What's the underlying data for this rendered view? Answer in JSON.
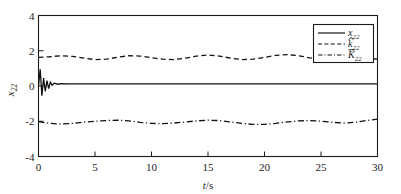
{
  "chart_data": {
    "type": "line",
    "title": "",
    "xlabel": "t/s",
    "ylabel": "x22",
    "xlim": [
      0,
      30
    ],
    "ylim": [
      -4,
      4
    ],
    "xticks": [
      "0",
      "5",
      "10",
      "15",
      "20",
      "25",
      "30"
    ],
    "xtick_values": [
      0,
      5,
      10,
      15,
      20,
      25,
      30
    ],
    "yticks": [
      "4",
      "2",
      "0",
      "-2",
      "-4"
    ],
    "ytick_values": [
      4,
      2,
      0,
      -2,
      -4
    ],
    "grid": false,
    "legend_position": "upper right",
    "series": [
      {
        "name": "x22",
        "label_base": "x",
        "label_sub": "22",
        "label_accent": "none",
        "style": "solid",
        "color": "#111111",
        "x": [
          0,
          0.15,
          0.3,
          0.45,
          0.6,
          0.75,
          0.9,
          1.05,
          1.2,
          1.4,
          1.7,
          2,
          2.5,
          3,
          4,
          5,
          6,
          7,
          8,
          9,
          10,
          12,
          14,
          16,
          18,
          20,
          22,
          24,
          26,
          28,
          30
        ],
        "y": [
          0.0,
          0.95,
          -0.55,
          0.45,
          -0.3,
          0.3,
          -0.15,
          0.22,
          0.05,
          0.16,
          0.1,
          0.13,
          0.12,
          0.12,
          0.12,
          0.12,
          0.12,
          0.12,
          0.12,
          0.12,
          0.12,
          0.12,
          0.12,
          0.12,
          0.12,
          0.12,
          0.12,
          0.12,
          0.12,
          0.12,
          0.12
        ]
      },
      {
        "name": "khat22",
        "label_base": "k",
        "label_sub": "22",
        "label_accent": "hat",
        "style": "dashed",
        "color": "#111111",
        "x": [
          0,
          1,
          2,
          3,
          4,
          5,
          6,
          7,
          8,
          9,
          10,
          11,
          12,
          13,
          14,
          15,
          16,
          17,
          18,
          19,
          20,
          21,
          22,
          23,
          24,
          25,
          26,
          27,
          28,
          29,
          30
        ],
        "y": [
          1.62,
          1.66,
          1.72,
          1.68,
          1.58,
          1.5,
          1.52,
          1.63,
          1.72,
          1.7,
          1.6,
          1.52,
          1.5,
          1.58,
          1.7,
          1.76,
          1.7,
          1.58,
          1.5,
          1.52,
          1.62,
          1.74,
          1.78,
          1.72,
          1.6,
          1.52,
          1.5,
          1.54,
          1.6,
          1.58,
          1.52
        ]
      },
      {
        "name": "Kbar22",
        "label_base": "K",
        "label_sub": "22",
        "label_accent": "bar",
        "style": "dashdot",
        "color": "#111111",
        "x": [
          0,
          1,
          2,
          3,
          4,
          5,
          6,
          7,
          8,
          9,
          10,
          11,
          12,
          13,
          14,
          15,
          16,
          17,
          18,
          19,
          20,
          21,
          22,
          23,
          24,
          25,
          26,
          27,
          28,
          29,
          30
        ],
        "y": [
          -2.02,
          -2.12,
          -2.16,
          -2.12,
          -2.05,
          -2.0,
          -1.96,
          -1.94,
          -1.98,
          -2.06,
          -2.12,
          -2.14,
          -2.1,
          -2.04,
          -1.98,
          -1.94,
          -1.96,
          -2.04,
          -2.12,
          -2.18,
          -2.18,
          -2.12,
          -2.04,
          -1.98,
          -1.96,
          -2.0,
          -2.06,
          -2.1,
          -2.06,
          -1.96,
          -1.88
        ]
      }
    ]
  }
}
